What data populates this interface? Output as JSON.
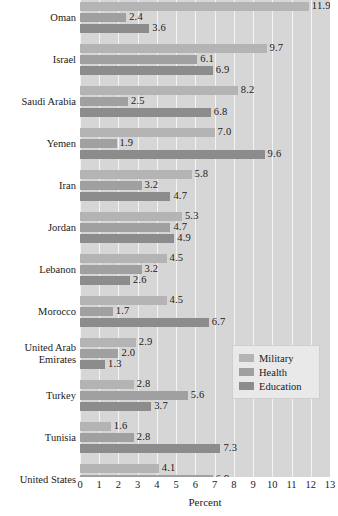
{
  "chart_data": {
    "type": "bar",
    "orientation": "horizontal",
    "title": "",
    "xlabel": "Percent",
    "ylabel": "",
    "xlim": [
      0,
      13
    ],
    "xticks": [
      "0",
      "1",
      "2",
      "3",
      "4",
      "5",
      "6",
      "7",
      "8",
      "9",
      "10",
      "11",
      "12",
      "13"
    ],
    "grid": true,
    "legend_position": "bottom-right",
    "categories": [
      "Oman",
      "Israel",
      "Saudi Arabia",
      "Yemen",
      "Iran",
      "Jordan",
      "Lebanon",
      "Morocco",
      "United Arab\nEmirates",
      "Turkey",
      "Tunisia",
      "United States"
    ],
    "series": [
      {
        "name": "Military",
        "color": "#b4b4b4",
        "values": [
          11.9,
          9.7,
          8.2,
          7.0,
          5.8,
          5.3,
          4.5,
          4.5,
          2.9,
          2.8,
          1.6,
          4.1
        ]
      },
      {
        "name": "Health",
        "color": "#a0a0a0",
        "values": [
          2.4,
          6.1,
          2.5,
          1.9,
          3.2,
          4.7,
          3.2,
          1.7,
          2.0,
          5.6,
          2.8,
          6.9
        ]
      },
      {
        "name": "Education",
        "color": "#8c8c8c",
        "values": [
          3.6,
          6.9,
          6.8,
          9.6,
          4.7,
          4.9,
          2.6,
          6.7,
          1.3,
          3.7,
          7.3,
          5.9
        ]
      }
    ]
  },
  "legend": {
    "items": [
      {
        "label": "Military"
      },
      {
        "label": "Health"
      },
      {
        "label": "Education"
      }
    ]
  },
  "axis": {
    "x_title": "Percent"
  },
  "colors": {
    "plot_background": "#d6d6d6",
    "gridline": "#f4f4f4",
    "military": "#b4b4b4",
    "health": "#a0a0a0",
    "education": "#8c8c8c",
    "text": "#1a1a1a"
  }
}
